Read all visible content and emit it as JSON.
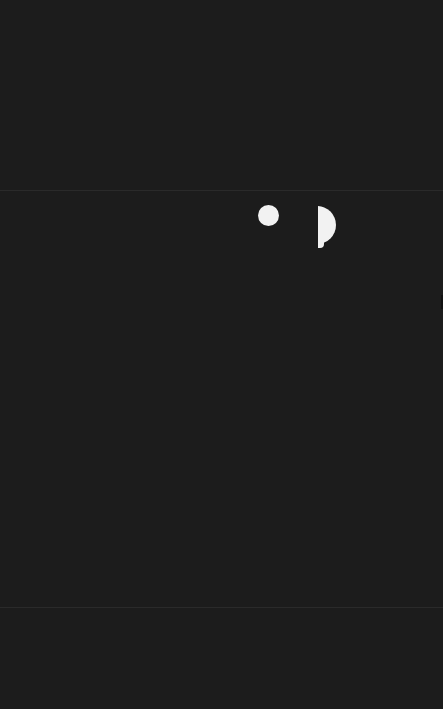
{
  "screen": {
    "background": "#1c1c1c",
    "state": "dark / mostly blank screen"
  },
  "dividers": [
    {
      "name": "top-divider",
      "y": 190,
      "color": "#2a2a2a"
    },
    {
      "name": "bottom-divider",
      "y": 607,
      "color": "#2a2a2a"
    }
  ],
  "indicators": {
    "dot": {
      "icon": "circle-dot-icon",
      "color": "#f2f2f2"
    },
    "half_shape": {
      "icon": "half-circle-icon",
      "color": "#f2f2f2"
    }
  }
}
